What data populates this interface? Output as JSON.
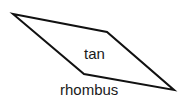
{
  "diagram": {
    "shape": "rhombus",
    "vertices": [
      [
        13,
        14
      ],
      [
        107,
        32
      ],
      [
        174,
        90
      ],
      [
        84,
        74
      ]
    ],
    "stroke_color": "#111111",
    "fill_color": "#ffffff",
    "labels": {
      "inner": "tan",
      "outer": "rhombus"
    }
  }
}
